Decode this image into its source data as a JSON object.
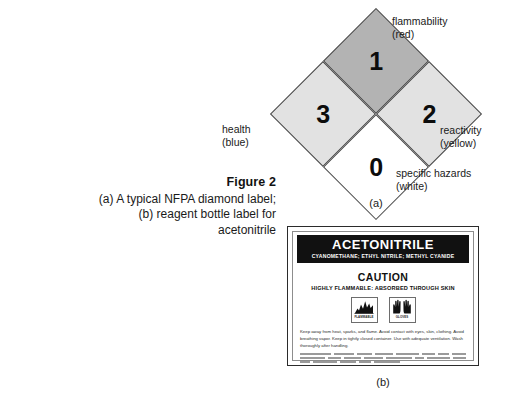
{
  "caption": {
    "figure_title": "Figure 2",
    "lines": [
      "(a) A typical NFPA diamond label;",
      "(b) reagent bottle label for",
      "acetonitrile"
    ]
  },
  "nfpa_diamond": {
    "sublabel": "(a)",
    "quadrants": {
      "flammability": {
        "value": "1",
        "label": "flammability",
        "color_word": "(red)",
        "fill": "#b3b3b3"
      },
      "health": {
        "value": "3",
        "label": "health",
        "color_word": "(blue)",
        "fill": "#e2e2e2"
      },
      "reactivity": {
        "value": "2",
        "label": "reactivity",
        "color_word": "(yellow)",
        "fill": "#e2e2e2"
      },
      "specific_hazards": {
        "value": "0",
        "label": "specific hazards",
        "color_word": "(white)",
        "fill": "#ffffff"
      }
    }
  },
  "bottle_label": {
    "sublabel": "(b)",
    "chemical_name": "ACETONITRILE",
    "synonyms": "CYANOMETHANE; ETHYL NITRILE; METHYL CYANIDE",
    "signal_word": "CAUTION",
    "hazard_statement": "HIGHLY FLAMMABLE: ABSORBED THROUGH SKIN",
    "pictograms": [
      {
        "icon": "flame-icon",
        "caption": "FLAMMABLE"
      },
      {
        "icon": "gloves-icon",
        "caption": "GLOVES"
      }
    ],
    "precautionary_text": "Keep away from heat, sparks, and flame. Avoid contact with eyes, skin, clothing. Avoid breathing vapor. Keep in tightly closed container. Use with adequate ventilation. Wash thoroughly after handling.",
    "fine_print_rows": [
      [
        34,
        22,
        17,
        20,
        25,
        14,
        12,
        16,
        20
      ],
      [
        26,
        14,
        18,
        20,
        28,
        9,
        24,
        14
      ],
      [
        10,
        24,
        16,
        12,
        26
      ]
    ]
  }
}
